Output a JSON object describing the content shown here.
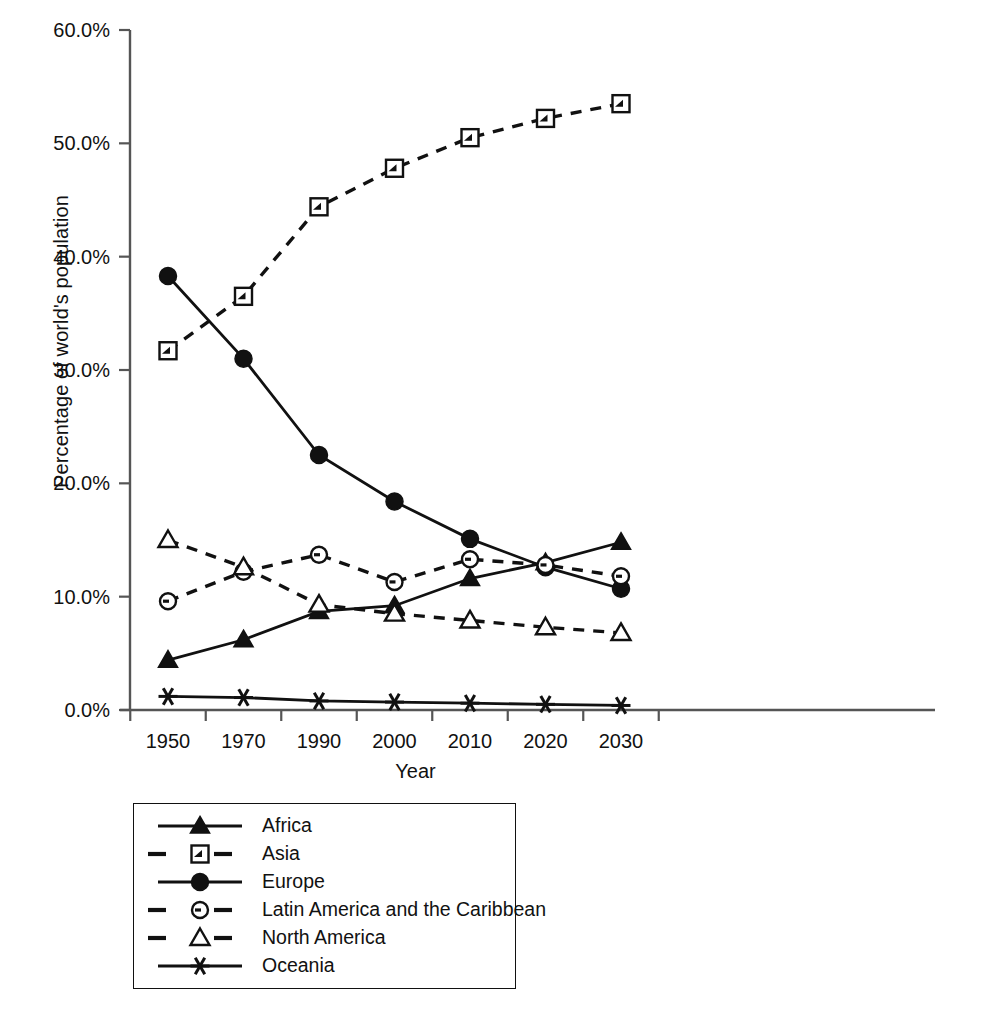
{
  "chart": {
    "type": "line",
    "title": "",
    "xlabel": "Year",
    "ylabel": "Percentage of world's population",
    "xtick_labels": [
      "1950",
      "1970",
      "1990",
      "2000",
      "2010",
      "2020",
      "2030"
    ],
    "ytick_labels": [
      "0.0%",
      "10.0%",
      "20.0%",
      "30.0%",
      "40.0%",
      "50.0%",
      "60.0%"
    ],
    "legend_position": "below-left"
  },
  "chart_data": {
    "type": "line",
    "title": "",
    "xlabel": "Year",
    "ylabel": "Percentage of world's population",
    "categories": [
      "1950",
      "1970",
      "1990",
      "2000",
      "2010",
      "2020",
      "2030"
    ],
    "x": [
      1950,
      1970,
      1990,
      2000,
      2010,
      2020,
      2030
    ],
    "ylim": [
      0,
      60
    ],
    "yticks": [
      0,
      10,
      20,
      30,
      40,
      50,
      60
    ],
    "ytick_labels": [
      "0.0%",
      "10.0%",
      "20.0%",
      "30.0%",
      "40.0%",
      "50.0%",
      "60.0%"
    ],
    "grid": false,
    "legend": [
      "Africa",
      "Asia",
      "Europe",
      "Latin America and the Caribbean",
      "North America",
      "Oceania"
    ],
    "series": [
      {
        "name": "Africa",
        "marker": "filled-triangle",
        "line": "solid",
        "values": [
          4.4,
          6.2,
          8.7,
          9.2,
          11.6,
          13.0,
          14.8
        ]
      },
      {
        "name": "Asia",
        "marker": "square-dot",
        "line": "dashed",
        "values": [
          31.7,
          36.5,
          44.4,
          47.8,
          50.5,
          52.2,
          53.5
        ]
      },
      {
        "name": "Europe",
        "marker": "filled-circle",
        "line": "solid",
        "values": [
          38.3,
          31.0,
          22.5,
          18.4,
          15.1,
          12.6,
          10.7
        ]
      },
      {
        "name": "Latin America and the Caribbean",
        "marker": "circle-dot",
        "line": "dashed",
        "values": [
          9.6,
          12.2,
          13.7,
          11.3,
          13.3,
          12.8,
          11.8
        ]
      },
      {
        "name": "North America",
        "marker": "open-triangle",
        "line": "dashed",
        "values": [
          15.0,
          12.6,
          9.3,
          8.5,
          7.9,
          7.3,
          6.8
        ]
      },
      {
        "name": "Oceania",
        "marker": "asterisk",
        "line": "solid",
        "values": [
          1.2,
          1.1,
          0.8,
          0.7,
          0.6,
          0.5,
          0.4
        ]
      }
    ]
  },
  "legend": {
    "items": [
      {
        "label": "Africa",
        "marker": "filled-triangle",
        "line": "solid"
      },
      {
        "label": "Asia",
        "marker": "square-dot",
        "line": "dashed"
      },
      {
        "label": "Europe",
        "marker": "filled-circle",
        "line": "solid"
      },
      {
        "label": "Latin America and the Caribbean",
        "marker": "circle-dot",
        "line": "dashed"
      },
      {
        "label": "North America",
        "marker": "open-triangle",
        "line": "dashed"
      },
      {
        "label": "Oceania",
        "marker": "asterisk",
        "line": "solid"
      }
    ]
  },
  "colors": {
    "ink": "#111111",
    "axis": "#555555",
    "background": "#ffffff"
  }
}
